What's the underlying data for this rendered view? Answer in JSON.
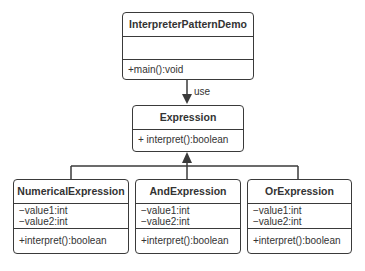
{
  "diagram": {
    "type": "uml-class-diagram",
    "classes": [
      {
        "id": "demo",
        "name": "InterpreterPatternDemo",
        "attributes": [],
        "methods": [
          "+main():void"
        ]
      },
      {
        "id": "expression",
        "name": "Expression",
        "attributes": null,
        "methods": [
          "+ interpret():boolean"
        ]
      },
      {
        "id": "numerical",
        "name": "NumericalExpression",
        "attributes": [
          "−value1:int",
          "−value2:int"
        ],
        "methods": [
          "+interpret():boolean"
        ]
      },
      {
        "id": "and",
        "name": "AndExpression",
        "attributes": [
          "−value1:int",
          "−value2:int"
        ],
        "methods": [
          "+interpret():boolean"
        ]
      },
      {
        "id": "or",
        "name": "OrExpression",
        "attributes": [
          "−value1:int",
          "−value2:int"
        ],
        "methods": [
          "+interpret():boolean"
        ]
      }
    ],
    "relations": [
      {
        "from": "demo",
        "to": "expression",
        "kind": "dependency",
        "label": "use"
      },
      {
        "from": "numerical",
        "to": "expression",
        "kind": "generalization"
      },
      {
        "from": "and",
        "to": "expression",
        "kind": "generalization"
      },
      {
        "from": "or",
        "to": "expression",
        "kind": "generalization"
      }
    ],
    "colors": {
      "stroke": "#3a3a3a",
      "text": "#333333",
      "background": "#ffffff"
    }
  }
}
